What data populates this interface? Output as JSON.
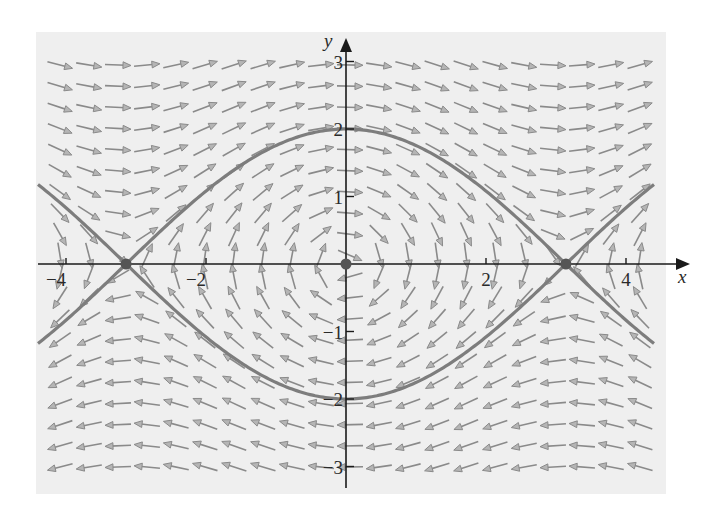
{
  "chart_data": {
    "type": "vector_field",
    "title": "",
    "xlabel": "x",
    "ylabel": "y",
    "xlim": [
      -4.4,
      4.4
    ],
    "ylim": [
      -3.3,
      3.3
    ],
    "grid": false,
    "x_ticks": [
      {
        "value": -4,
        "label": "−4"
      },
      {
        "value": -2,
        "label": "−2"
      },
      {
        "value": 2,
        "label": "2"
      },
      {
        "value": 4,
        "label": "4"
      }
    ],
    "y_ticks": [
      {
        "value": 3,
        "label": "3"
      },
      {
        "value": 2,
        "label": "2"
      },
      {
        "value": 1,
        "label": "1"
      },
      {
        "value": -1,
        "label": "−1"
      },
      {
        "value": -2,
        "label": "−2"
      },
      {
        "value": -3,
        "label": "−3"
      }
    ],
    "field": {
      "dx": "y",
      "dy": "-sin(x)",
      "columns": 21,
      "rows": 20
    },
    "series": [
      {
        "name": "separatrix-upper",
        "equation": "y = 2cos(x/2)",
        "x_range": [
          -4.4,
          4.4
        ]
      },
      {
        "name": "separatrix-lower",
        "equation": "y = -2cos(x/2)",
        "x_range": [
          -4.4,
          4.4
        ]
      }
    ],
    "equilibria": [
      {
        "x": -3.14159,
        "y": 0,
        "type": "saddle"
      },
      {
        "x": 0,
        "y": 0,
        "type": "center"
      },
      {
        "x": 3.14159,
        "y": 0,
        "type": "saddle"
      }
    ],
    "colors": {
      "panel_background": "#efefef",
      "arrow": "#8a8a8a",
      "separatrix": "#7d7d7d",
      "axis": "#1a1a1a",
      "equilibrium": "#555555"
    }
  }
}
